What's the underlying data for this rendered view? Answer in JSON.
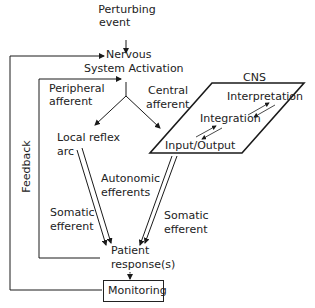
{
  "diagram": {
    "nodes": {
      "perturbing_event": "Perturbing\nevent",
      "perturbing_line1": "Perturbing",
      "perturbing_line2": "event",
      "nervous_line1": "Nervous",
      "nervous_line2": "System Activation",
      "peripheral_line1": "Peripheral",
      "peripheral_line2": "afferent",
      "central_line1": "Central",
      "central_line2": "afferent",
      "cns_title": "CNS",
      "interpretation": "Interpretation",
      "integration": "Integration",
      "input_output": "Input/Output",
      "local_reflex_line1": "Local reflex",
      "local_reflex_line2": "arc",
      "autonomic_line1": "Autonomic",
      "autonomic_line2": "efferents",
      "somatic_left_line1": "Somatic",
      "somatic_left_line2": "efferent",
      "somatic_right_line1": "Somatic",
      "somatic_right_line2": "efferent",
      "patient_line1": "Patient",
      "patient_line2": "response(s)",
      "monitoring": "Monitoring",
      "feedback": "Feedback"
    },
    "colors": {
      "line": "#1a1a1a",
      "background": "#ffffff"
    }
  }
}
